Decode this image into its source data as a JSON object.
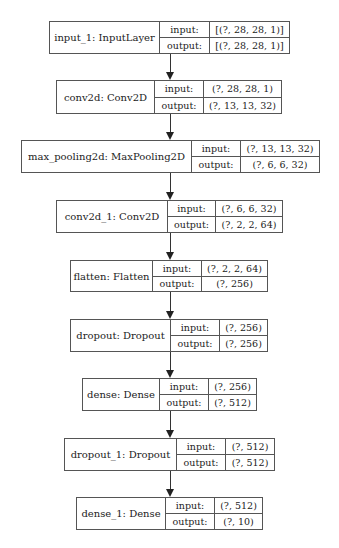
{
  "diagram": {
    "nodes": [
      {
        "name": "input_1: InputLayer",
        "input_label": "input:",
        "output_label": "output:",
        "input": "[(?, 28, 28, 1)]",
        "output": "[(?, 28, 28, 1)]"
      },
      {
        "name": "conv2d: Conv2D",
        "input_label": "input:",
        "output_label": "output:",
        "input": "(?, 28, 28, 1)",
        "output": "(?, 13, 13, 32)"
      },
      {
        "name": "max_pooling2d: MaxPooling2D",
        "input_label": "input:",
        "output_label": "output:",
        "input": "(?, 13, 13, 32)",
        "output": "(?, 6, 6, 32)"
      },
      {
        "name": "conv2d_1: Conv2D",
        "input_label": "input:",
        "output_label": "output:",
        "input": "(?, 6, 6, 32)",
        "output": "(?, 2, 2, 64)"
      },
      {
        "name": "flatten: Flatten",
        "input_label": "input:",
        "output_label": "output:",
        "input": "(?, 2, 2, 64)",
        "output": "(?, 256)"
      },
      {
        "name": "dropout: Dropout",
        "input_label": "input:",
        "output_label": "output:",
        "input": "(?, 256)",
        "output": "(?, 256)"
      },
      {
        "name": "dense: Dense",
        "input_label": "input:",
        "output_label": "output:",
        "input": "(?, 256)",
        "output": "(?, 512)"
      },
      {
        "name": "dropout_1: Dropout",
        "input_label": "input:",
        "output_label": "output:",
        "input": "(?, 512)",
        "output": "(?, 512)"
      },
      {
        "name": "dense_1: Dense",
        "input_label": "input:",
        "output_label": "output:",
        "input": "(?, 512)",
        "output": "(?, 10)"
      }
    ]
  }
}
